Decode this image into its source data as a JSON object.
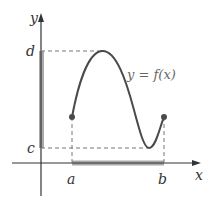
{
  "figure": {
    "axis_labels": {
      "x": "x",
      "y": "y"
    },
    "tick_labels": {
      "a": "a",
      "b": "b",
      "c": "c",
      "d": "d"
    },
    "curve_label": "y = f(x)",
    "colors": {
      "axis": "#333333",
      "curve": "#4a4a4a",
      "dashed": "#777777",
      "shaded_interval": "#a9a9a9",
      "endpoint": "#4a4a4a"
    }
  }
}
